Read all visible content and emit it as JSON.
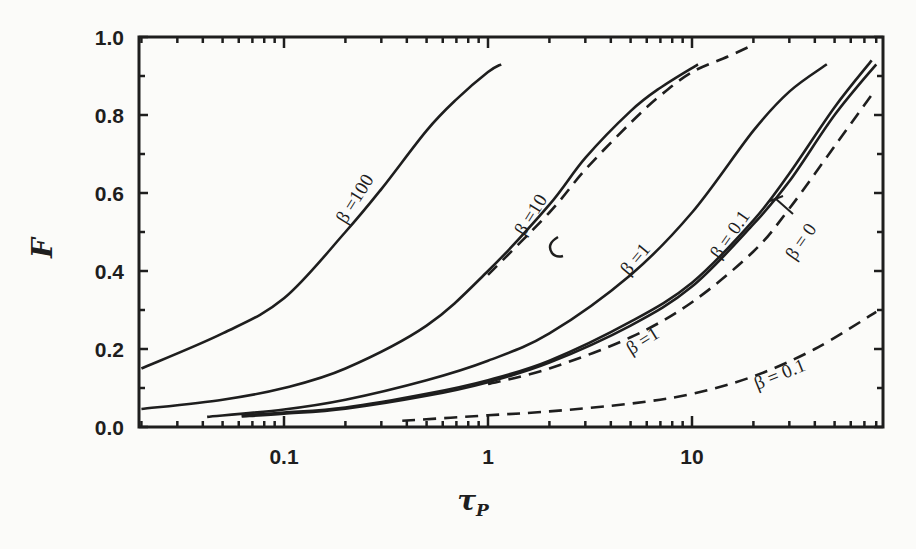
{
  "chart_data": {
    "type": "line",
    "title": "",
    "xlabel": "τ_P",
    "ylabel": "F",
    "xscale": "log",
    "xlim": [
      0.02,
      80
    ],
    "ylim": [
      0.0,
      1.0
    ],
    "grid": false,
    "legend": "inline labels on curves",
    "x_ticks": [
      {
        "value": 0.1,
        "label": "0.1"
      },
      {
        "value": 1,
        "label": "1"
      },
      {
        "value": 10,
        "label": "10"
      }
    ],
    "y_ticks": [
      {
        "value": 0.0,
        "label": "0.0"
      },
      {
        "value": 0.2,
        "label": "0.2"
      },
      {
        "value": 0.4,
        "label": "0.4"
      },
      {
        "value": 0.6,
        "label": "0.6"
      },
      {
        "value": 0.8,
        "label": "0.8"
      },
      {
        "value": 1.0,
        "label": "1.0"
      }
    ],
    "series": [
      {
        "name": "β = 100",
        "style": "solid",
        "x": [
          0.02,
          0.05,
          0.1,
          0.2,
          0.3,
          0.5,
          0.7,
          1.0,
          1.16
        ],
        "y": [
          0.15,
          0.24,
          0.33,
          0.5,
          0.61,
          0.76,
          0.84,
          0.91,
          0.93
        ]
      },
      {
        "name": "β = 10",
        "style": "solid",
        "x": [
          0.02,
          0.05,
          0.1,
          0.2,
          0.5,
          1.0,
          2.0,
          3.0,
          5.0,
          7.0,
          10.7
        ],
        "y": [
          0.046,
          0.07,
          0.1,
          0.15,
          0.26,
          0.4,
          0.57,
          0.69,
          0.81,
          0.87,
          0.93
        ]
      },
      {
        "name": "β = 10 (dashed)",
        "style": "dashed",
        "x": [
          1.0,
          2.0,
          3.0,
          5.0,
          7.0,
          10.0,
          15.0,
          20.0
        ],
        "y": [
          0.39,
          0.55,
          0.66,
          0.78,
          0.85,
          0.91,
          0.95,
          0.98
        ]
      },
      {
        "name": "β = 1",
        "style": "solid",
        "x": [
          0.042,
          0.1,
          0.2,
          0.5,
          1.0,
          2.0,
          5.0,
          10.0,
          20.0,
          30.0,
          45.8
        ],
        "y": [
          0.026,
          0.045,
          0.07,
          0.12,
          0.17,
          0.24,
          0.39,
          0.55,
          0.76,
          0.86,
          0.93
        ]
      },
      {
        "name": "β = 0.1",
        "style": "solid",
        "x": [
          0.062,
          0.1,
          0.2,
          0.5,
          1.0,
          2.0,
          5.0,
          10.0,
          20.0,
          30.0,
          50.0,
          76.0
        ],
        "y": [
          0.03,
          0.037,
          0.05,
          0.085,
          0.12,
          0.17,
          0.27,
          0.37,
          0.53,
          0.65,
          0.82,
          0.94
        ]
      },
      {
        "name": "β = 0",
        "style": "solid",
        "x": [
          0.062,
          0.1,
          0.2,
          0.5,
          1.0,
          2.0,
          5.0,
          10.0,
          20.0,
          30.0,
          50.0,
          80.0
        ],
        "y": [
          0.027,
          0.034,
          0.047,
          0.08,
          0.115,
          0.165,
          0.26,
          0.36,
          0.52,
          0.63,
          0.8,
          0.93
        ]
      },
      {
        "name": "β = 1 (dashed)",
        "style": "dashed",
        "x": [
          1.0,
          2.0,
          5.0,
          10.0,
          20.0,
          30.0,
          50.0,
          78.0
        ],
        "y": [
          0.11,
          0.15,
          0.23,
          0.32,
          0.45,
          0.56,
          0.72,
          0.86
        ]
      },
      {
        "name": "β = 0.1 (dashed)",
        "style": "dashed",
        "x": [
          0.38,
          1.0,
          2.0,
          5.0,
          10.0,
          20.0,
          40.0,
          80.0
        ],
        "y": [
          0.016,
          0.03,
          0.04,
          0.06,
          0.085,
          0.13,
          0.2,
          0.295
        ]
      }
    ],
    "annotations": [
      {
        "text": "β =100",
        "x_px": 360,
        "y_px": 202,
        "angle": -58
      },
      {
        "text": "β =10",
        "x_px": 536,
        "y_px": 218,
        "angle": -58
      },
      {
        "text": "β =1",
        "x_px": 640,
        "y_px": 263,
        "angle": -50
      },
      {
        "text": "β = 0.1",
        "x_px": 735,
        "y_px": 238,
        "angle": -55
      },
      {
        "text": "β = 0",
        "x_px": 806,
        "y_px": 245,
        "angle": -55
      },
      {
        "text": "β =1",
        "x_px": 646,
        "y_px": 346,
        "angle": -32
      },
      {
        "text": "β = 0.1",
        "x_px": 782,
        "y_px": 380,
        "angle": -22
      }
    ]
  },
  "axes": {
    "x_title": "τ",
    "x_title_sub": "P",
    "y_title": "F"
  }
}
